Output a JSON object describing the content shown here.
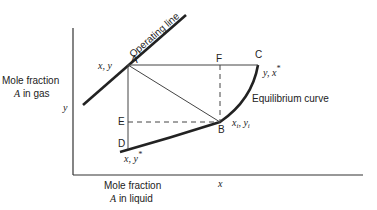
{
  "diagram": {
    "y_axis_label_line1": "Mole fraction",
    "y_axis_label_line2_var": "A",
    "y_axis_label_line2_rest": " in gas",
    "x_axis_label_line1": "Mole fraction",
    "x_axis_label_line2_var": "A",
    "x_axis_label_line2_rest": " in liquid",
    "y_symbol": "y",
    "x_symbol": "x",
    "operating_line_label": "Operating line",
    "equilibrium_curve_label": "Equilibrium curve",
    "points": {
      "A": {
        "label": "A",
        "annotation": "x, y"
      },
      "B": {
        "label": "B",
        "annotation_main": "x",
        "annotation_sub1": "i",
        "annotation_sep": ", y",
        "annotation_sub2": "i"
      },
      "C": {
        "label": "C",
        "annotation": "y,  x",
        "annotation_sup": "*"
      },
      "D": {
        "label": "D",
        "annotation": "x, y",
        "annotation_sup": "*"
      },
      "E": {
        "label": "E"
      },
      "F": {
        "label": "F"
      }
    },
    "colors": {
      "line": "#222222",
      "thin_line": "#444444",
      "background": "#ffffff"
    }
  }
}
